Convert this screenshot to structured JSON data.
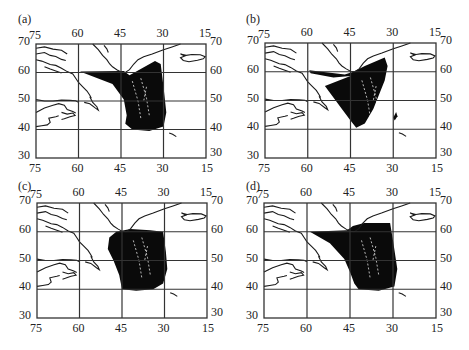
{
  "chart_data": [
    {
      "type": "heatmap",
      "panel_label": "(a)",
      "title": "",
      "xlabel": "",
      "ylabel": "",
      "x_ticks_top": [
        "75",
        "60",
        "45",
        "30",
        "15"
      ],
      "x_ticks_bottom": [
        "75",
        "60",
        "45",
        "30",
        "15"
      ],
      "y_ticks_left": [
        "70",
        "60",
        "50",
        "40",
        "30"
      ],
      "y_ticks_right": [
        "70",
        "60",
        "50",
        "40",
        "30"
      ],
      "xlim": [
        75,
        15
      ],
      "ylim": [
        30,
        70
      ],
      "x_units": "degrees West longitude",
      "y_units": "degrees North latitude",
      "grid": true,
      "description": "Black filled data swath over North Atlantic, fan-shaped from ~60W,60N to ~29W,64N down to ~43-31W,40N",
      "region_lonlat": [
        [
          59.5,
          60.3
        ],
        [
          48,
          56
        ],
        [
          44,
          50.5
        ],
        [
          43,
          45
        ],
        [
          43.5,
          42
        ],
        [
          41,
          40
        ],
        [
          35,
          39.5
        ],
        [
          30,
          41
        ],
        [
          29,
          46
        ],
        [
          30,
          55
        ],
        [
          31,
          63
        ],
        [
          33,
          64
        ],
        [
          42,
          59
        ],
        [
          44,
          60.5
        ]
      ]
    },
    {
      "type": "heatmap",
      "panel_label": "(b)",
      "title": "",
      "xlabel": "",
      "ylabel": "",
      "x_ticks_top": [
        "75",
        "60",
        "45",
        "30",
        "15"
      ],
      "x_ticks_bottom": [
        "75",
        "60",
        "45",
        "30",
        "15"
      ],
      "y_ticks_left": [
        "70",
        "60",
        "50",
        "40",
        "30"
      ],
      "y_ticks_right": [
        "70",
        "60",
        "50",
        "40",
        "30"
      ],
      "xlim": [
        75,
        15
      ],
      "ylim": [
        30,
        70
      ],
      "grid": true,
      "description": "Sparser black data: band along ~60N from 60W to 30W, V-shaped swath converging near 43W,40N, patch near 29W,43N",
      "region_lonlat": [
        [
          59.5,
          60.5
        ],
        [
          47,
          59
        ],
        [
          44,
          60
        ],
        [
          40,
          62
        ],
        [
          33,
          65
        ],
        [
          32,
          62
        ],
        [
          33,
          57
        ],
        [
          35,
          52
        ],
        [
          37,
          47
        ],
        [
          40,
          42
        ],
        [
          43,
          40.5
        ],
        [
          45,
          43
        ],
        [
          48,
          47
        ],
        [
          51,
          51
        ],
        [
          54,
          55
        ],
        [
          45,
          58.5
        ],
        [
          51,
          58
        ],
        [
          59,
          59.5
        ]
      ],
      "extra_patch_lonlat": [
        [
          29.5,
          43
        ],
        [
          28.5,
          44.5
        ],
        [
          29,
          46
        ],
        [
          30,
          44
        ]
      ]
    },
    {
      "type": "heatmap",
      "panel_label": "(c)",
      "title": "",
      "xlabel": "",
      "ylabel": "",
      "x_ticks_top": [
        "75",
        "60",
        "45",
        "30",
        "15"
      ],
      "x_ticks_bottom": [
        "75",
        "60",
        "45",
        "30",
        "15"
      ],
      "y_ticks_left": [
        "70",
        "60",
        "50",
        "40",
        "30"
      ],
      "y_ticks_right": [
        "70",
        "60",
        "50",
        "40",
        "30"
      ],
      "xlim": [
        75,
        15
      ],
      "ylim": [
        30,
        70
      ],
      "grid": true,
      "description": "Rounded black data blob centered ~40W,50N spanning ~50-29W, 39-61N",
      "region_lonlat": [
        [
          49.5,
          58
        ],
        [
          47,
          60
        ],
        [
          42,
          61
        ],
        [
          35,
          60.5
        ],
        [
          30.5,
          60
        ],
        [
          29.5,
          53
        ],
        [
          29,
          47
        ],
        [
          30.5,
          42
        ],
        [
          34,
          40
        ],
        [
          40,
          39.5
        ],
        [
          45,
          40
        ],
        [
          46,
          45
        ],
        [
          48,
          50
        ],
        [
          50,
          54
        ]
      ]
    },
    {
      "type": "heatmap",
      "panel_label": "(d)",
      "title": "",
      "xlabel": "",
      "ylabel": "",
      "x_ticks_top": [
        "75",
        "60",
        "45",
        "30",
        "15"
      ],
      "x_ticks_bottom": [
        "75",
        "60",
        "45",
        "30",
        "15"
      ],
      "y_ticks_left": [
        "70",
        "60",
        "50",
        "40",
        "30"
      ],
      "y_ticks_right": [
        "70",
        "60",
        "50",
        "40",
        "30"
      ],
      "xlim": [
        75,
        15
      ],
      "ylim": [
        30,
        70
      ],
      "grid": true,
      "description": "Large black swath fan from ~59W,60N and 31W,63N down to ~43-29W,40N",
      "region_lonlat": [
        [
          59,
          60
        ],
        [
          52,
          56
        ],
        [
          47,
          50.5
        ],
        [
          45,
          46
        ],
        [
          43.5,
          42
        ],
        [
          42,
          40
        ],
        [
          35,
          39.5
        ],
        [
          29.5,
          41
        ],
        [
          28.5,
          47
        ],
        [
          30,
          57
        ],
        [
          31,
          63
        ],
        [
          40,
          63
        ],
        [
          44,
          62
        ],
        [
          46,
          60.5
        ]
      ]
    }
  ],
  "panels": {
    "a": {
      "label": "(a)"
    },
    "b": {
      "label": "(b)"
    },
    "c": {
      "label": "(c)"
    },
    "d": {
      "label": "(d)"
    }
  },
  "colors": {
    "data_fill": "#0a0a0a",
    "coast": "#1a1a1a",
    "grid": "#333333",
    "background": "#ffffff"
  }
}
